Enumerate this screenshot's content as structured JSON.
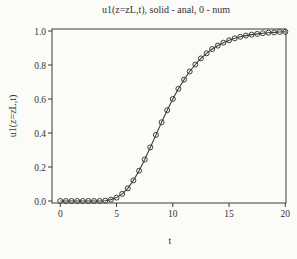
{
  "figure": {
    "background": "#fbfbf8",
    "ink": "#3d3d3d",
    "text_color": "#333333"
  },
  "chart_data": {
    "type": "line",
    "title": "u1(z=zL,t), solid - anal, 0 - num",
    "xlabel": "t",
    "ylabel": "u1(z=zL,t)",
    "xlim": [
      0,
      20
    ],
    "ylim": [
      0.0,
      1.0
    ],
    "grid": false,
    "legend": {
      "solid_line": "anal",
      "open_circles": "num"
    },
    "xticks": [
      0,
      5,
      10,
      15,
      20
    ],
    "yticks": [
      0.0,
      0.2,
      0.4,
      0.6,
      0.8,
      1.0
    ],
    "x": [
      0,
      0.5,
      1,
      1.5,
      2,
      2.5,
      3,
      3.5,
      4,
      4.5,
      5,
      5.5,
      6,
      6.5,
      7,
      7.5,
      8,
      8.5,
      9,
      9.5,
      10,
      10.5,
      11,
      11.5,
      12,
      12.5,
      13,
      13.5,
      14,
      14.5,
      15,
      15.5,
      16,
      16.5,
      17,
      17.5,
      18,
      18.5,
      19,
      19.5,
      20
    ],
    "series": [
      {
        "name": "anal",
        "style": "solid-line",
        "values": [
          0.0,
          0.0,
          0.0,
          0.0,
          0.0,
          0.0,
          0.0,
          0.0,
          0.002,
          0.008,
          0.02,
          0.042,
          0.075,
          0.121,
          0.178,
          0.244,
          0.315,
          0.389,
          0.463,
          0.534,
          0.6,
          0.66,
          0.714,
          0.762,
          0.803,
          0.839,
          0.869,
          0.894,
          0.914,
          0.931,
          0.945,
          0.957,
          0.966,
          0.973,
          0.979,
          0.983,
          0.987,
          0.99,
          0.992,
          0.994,
          0.995
        ]
      },
      {
        "name": "num",
        "style": "open-circle-markers",
        "values": [
          0.0,
          0.0,
          0.0,
          0.0,
          0.0,
          0.0,
          0.0,
          0.0,
          0.002,
          0.008,
          0.02,
          0.042,
          0.075,
          0.121,
          0.178,
          0.244,
          0.315,
          0.389,
          0.463,
          0.534,
          0.6,
          0.66,
          0.714,
          0.762,
          0.803,
          0.839,
          0.869,
          0.894,
          0.914,
          0.931,
          0.945,
          0.957,
          0.966,
          0.973,
          0.979,
          0.983,
          0.987,
          0.99,
          0.992,
          0.994,
          0.995
        ]
      }
    ]
  }
}
